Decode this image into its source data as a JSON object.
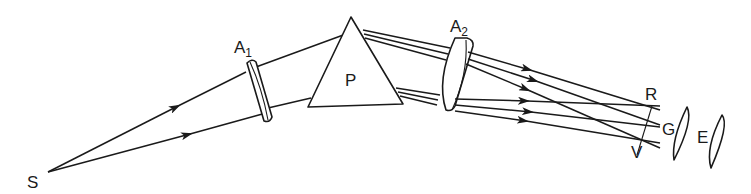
{
  "diagram": {
    "type": "optical-spectroscope-ray-diagram",
    "labels": {
      "source": "S",
      "lens1": "A",
      "lens1_sub": "1",
      "prism": "P",
      "lens2": "A",
      "lens2_sub": "2",
      "red": "R",
      "green": "G",
      "violet": "V",
      "eyepiece": "E"
    },
    "components": [
      {
        "id": "source",
        "label": "S",
        "kind": "point source"
      },
      {
        "id": "lens-a1",
        "label": "A1",
        "kind": "collimating lens"
      },
      {
        "id": "prism",
        "label": "P",
        "kind": "triangular prism"
      },
      {
        "id": "lens-a2",
        "label": "A2",
        "kind": "focusing lens"
      },
      {
        "id": "spectrum",
        "labels": [
          "R",
          "G",
          "V"
        ],
        "kind": "focal plane spectrum"
      },
      {
        "id": "eyepiece",
        "label": "E",
        "kind": "eyepiece lens"
      }
    ],
    "colors": {
      "ink": "#1a1a1a",
      "background": "#ffffff"
    }
  }
}
